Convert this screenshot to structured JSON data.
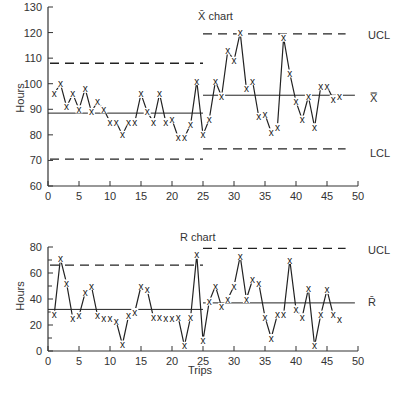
{
  "chart_data": [
    {
      "type": "line",
      "title": "X̄ chart",
      "xlabel": "",
      "ylabel": "Hours",
      "xlim": [
        0,
        50
      ],
      "ylim": [
        60,
        130
      ],
      "xticks": [
        0,
        5,
        10,
        15,
        20,
        25,
        30,
        35,
        40,
        45,
        50
      ],
      "yticks": [
        60,
        70,
        80,
        90,
        100,
        110,
        120,
        130
      ],
      "marker": "x",
      "grid": false,
      "x": [
        1,
        2,
        3,
        4,
        5,
        6,
        7,
        8,
        9,
        10,
        11,
        12,
        13,
        14,
        15,
        16,
        17,
        18,
        19,
        20,
        21,
        22,
        23,
        24,
        25,
        26,
        27,
        28,
        29,
        30,
        31,
        32,
        33,
        34,
        35,
        36,
        37,
        38,
        39,
        40,
        41,
        42,
        43,
        44,
        45,
        46,
        47
      ],
      "series": [
        {
          "name": "Sample mean",
          "values": [
            96,
            100,
            91,
            96,
            90,
            98,
            89,
            93,
            90,
            85,
            85,
            80,
            85,
            85,
            96,
            89,
            85,
            96,
            85,
            86,
            79,
            79,
            84,
            101,
            80,
            86,
            101,
            95,
            113,
            109,
            120,
            98,
            101,
            87,
            88,
            81,
            83,
            118,
            104,
            93,
            86,
            95,
            83,
            99,
            99,
            94,
            95
          ]
        }
      ],
      "control_limits": [
        {
          "segment": "trips 0-25",
          "UCL": 108,
          "center": 88.5,
          "LCL": 70.5
        },
        {
          "segment": "trips 25-47",
          "UCL": 119.5,
          "center": 95.5,
          "LCL": 74.5
        }
      ],
      "annotations": [
        "UCL",
        "X̿",
        "LCL"
      ]
    },
    {
      "type": "line",
      "title": "R chart",
      "xlabel": "Trips",
      "ylabel": "Hours",
      "xlim": [
        0,
        50
      ],
      "ylim": [
        0,
        80
      ],
      "xticks": [
        0,
        5,
        10,
        15,
        20,
        25,
        30,
        35,
        40,
        45,
        50
      ],
      "yticks": [
        0,
        20,
        40,
        60,
        80
      ],
      "marker": "x",
      "grid": false,
      "x": [
        1,
        2,
        3,
        4,
        5,
        6,
        7,
        8,
        9,
        10,
        11,
        12,
        13,
        14,
        15,
        16,
        17,
        18,
        19,
        20,
        21,
        22,
        23,
        24,
        25,
        26,
        27,
        28,
        29,
        30,
        31,
        32,
        33,
        34,
        35,
        36,
        37,
        38,
        39,
        40,
        41,
        42,
        43,
        44,
        45,
        46,
        47
      ],
      "series": [
        {
          "name": "Sample range",
          "values": [
            28,
            71,
            52,
            25,
            27,
            45,
            50,
            27,
            25,
            25,
            23,
            5,
            27,
            30,
            50,
            47,
            26,
            26,
            25,
            25,
            26,
            4,
            26,
            74,
            8,
            38,
            50,
            34,
            40,
            50,
            73,
            40,
            55,
            52,
            26,
            10,
            28,
            28,
            70,
            32,
            26,
            48,
            4,
            28,
            47,
            28,
            24
          ]
        }
      ],
      "control_limits": [
        {
          "segment": "trips 0-25",
          "UCL": 66,
          "center": 32
        },
        {
          "segment": "trips 25-47",
          "UCL": 79,
          "center": 37
        }
      ],
      "annotations": [
        "UCL",
        "R̄"
      ]
    }
  ],
  "labels": {
    "top_title": "X̄ chart",
    "bottom_title": "R chart",
    "ylabel": "Hours",
    "xlabel": "Trips",
    "ucl": "UCL",
    "lcl": "LCL",
    "xbarbar": "X̿",
    "rbar": "R̄",
    "marker": "x"
  },
  "style": {
    "line_color": "#222222",
    "axis_color": "#333333",
    "background": "#ffffff"
  }
}
